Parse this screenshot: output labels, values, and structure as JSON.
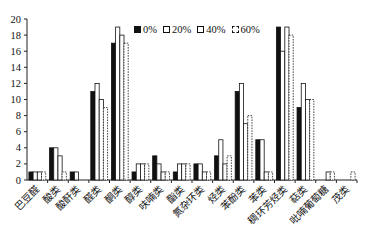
{
  "chart_data": {
    "type": "bar",
    "title": "",
    "xlabel": "",
    "ylabel": "",
    "ylim": [
      0,
      20
    ],
    "yticks": [
      0,
      2,
      4,
      6,
      8,
      10,
      12,
      14,
      16,
      18,
      20
    ],
    "grid": false,
    "legend_position": "top-center",
    "categories": [
      "巴豆醛",
      "酸类",
      "酸酐类",
      "醛类",
      "酮类",
      "醇类",
      "呋喃类",
      "酯类",
      "氮杂环类",
      "烃类",
      "苯酚类",
      "苯类",
      "稠环芳烃类",
      "萜类",
      "吡喃葡萄糖",
      "茂类"
    ],
    "series": [
      {
        "name": "0%",
        "style": "solid-black",
        "values": [
          1,
          4,
          1,
          11,
          17,
          1,
          3,
          1,
          2,
          3,
          11,
          5,
          19,
          9,
          0,
          0
        ]
      },
      {
        "name": "20%",
        "style": "white",
        "values": [
          1,
          4,
          1,
          12,
          19,
          2,
          2,
          2,
          2,
          5,
          12,
          5,
          16,
          12,
          0,
          0
        ]
      },
      {
        "name": "40%",
        "style": "white",
        "values": [
          1,
          3,
          0,
          10,
          18,
          2,
          1,
          2,
          1,
          2,
          7,
          1,
          19,
          10,
          1,
          0
        ]
      },
      {
        "name": "60%",
        "style": "dashed",
        "values": [
          1,
          1,
          0,
          9,
          17,
          2,
          1,
          2,
          1,
          3,
          8,
          1,
          18,
          10,
          1,
          1
        ]
      }
    ]
  },
  "legend": {
    "items": [
      {
        "label": "0%"
      },
      {
        "label": "20%"
      },
      {
        "label": "40%"
      },
      {
        "label": "60%"
      }
    ]
  }
}
